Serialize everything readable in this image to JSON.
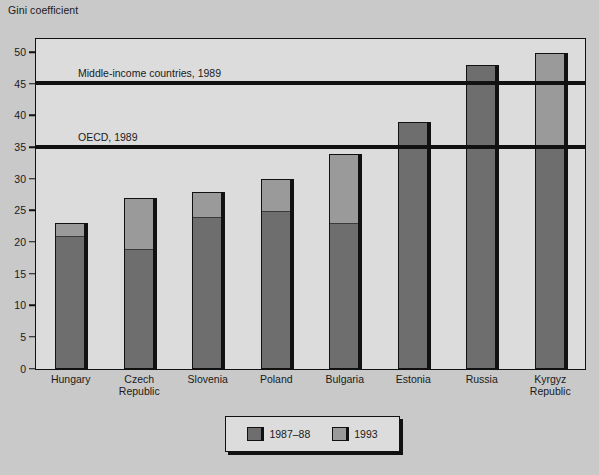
{
  "chart": {
    "axis_title": "Gini coefficient",
    "colors": {
      "series_1987_88": "#6e6e6e",
      "series_1993": "#9a9a9a",
      "outline": "#111111",
      "plot_background": "#dcdcdc",
      "page_background": "#c9c9c9",
      "reference_line": "#111111"
    }
  },
  "legend": {
    "items": [
      {
        "label": "1987–88",
        "color_key": "series_1987_88"
      },
      {
        "label": "1993",
        "color_key": "series_1993"
      }
    ]
  },
  "reference_lines": [
    {
      "label": "Middle-income countries, 1989",
      "value": 45
    },
    {
      "label": "OECD, 1989",
      "value": 35
    }
  ],
  "chart_data": {
    "type": "bar",
    "title": "",
    "subtitle": "",
    "xlabel": "",
    "ylabel": "Gini coefficient",
    "ylim": [
      0,
      52
    ],
    "yticks": [
      0,
      5,
      10,
      15,
      20,
      25,
      30,
      35,
      40,
      45,
      50
    ],
    "ytick_labels": [
      "0",
      "5",
      "10",
      "15",
      "20",
      "25",
      "30",
      "35",
      "40",
      "45",
      "50"
    ],
    "grid": false,
    "legend_position": "bottom-center",
    "stacked_overlay": true,
    "categories": [
      "Hungary",
      "Czech\nRepublic",
      "Slovenia",
      "Poland",
      "Bulgaria",
      "Estonia",
      "Russia",
      "Kyrgyz\nRepublic"
    ],
    "series": [
      {
        "name": "1987–88",
        "values": [
          21,
          19,
          24,
          25,
          23,
          39,
          48,
          35
        ]
      },
      {
        "name": "1993",
        "values": [
          23,
          27,
          28,
          30,
          34,
          39,
          48,
          50
        ]
      }
    ],
    "annotations": [
      {
        "text": "Middle-income countries, 1989",
        "y": 45,
        "type": "hline"
      },
      {
        "text": "OECD, 1989",
        "y": 35,
        "type": "hline"
      }
    ]
  }
}
